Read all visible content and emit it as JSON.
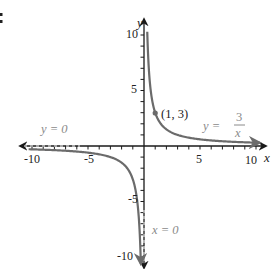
{
  "figure": {
    "panel_marker": "c"
  },
  "chart_data": {
    "type": "line",
    "title": "",
    "function": "y = 3/x",
    "xlabel": "x",
    "ylabel": "y",
    "xlim": [
      -10.5,
      10.5
    ],
    "ylim": [
      -10.5,
      10.5
    ],
    "x_ticks": [
      -10,
      -5,
      5,
      10
    ],
    "y_ticks": [
      10,
      5,
      -5,
      -10
    ],
    "tick_labels": {
      "x_neg10": "-10",
      "x_neg5": "-5",
      "x_5": "5",
      "x_10": "10",
      "y_10": "10",
      "y_5": "5",
      "y_neg5": "-5",
      "y_neg10": "-10"
    },
    "grid": false,
    "series": [
      {
        "name": "y = 3/x (positive branch)",
        "points": [
          [
            0.3,
            10
          ],
          [
            0.5,
            6
          ],
          [
            1,
            3
          ],
          [
            1.5,
            2
          ],
          [
            2,
            1.5
          ],
          [
            3,
            1
          ],
          [
            5,
            0.6
          ],
          [
            7,
            0.43
          ],
          [
            10,
            0.3
          ]
        ]
      },
      {
        "name": "y = 3/x (negative branch)",
        "points": [
          [
            -10,
            -0.3
          ],
          [
            -7,
            -0.43
          ],
          [
            -5,
            -0.6
          ],
          [
            -3,
            -1
          ],
          [
            -2,
            -1.5
          ],
          [
            -1.5,
            -2
          ],
          [
            -1,
            -3
          ],
          [
            -0.5,
            -6
          ],
          [
            -0.3,
            -10
          ]
        ]
      }
    ],
    "annotations": {
      "point": {
        "x": 1,
        "y": 3,
        "label": "(1, 3)"
      },
      "function_label": {
        "lhs": "y =",
        "numerator": "3",
        "denominator": "x"
      },
      "horizontal_asymptote": "y = 0",
      "vertical_asymptote": "x = 0"
    },
    "colors": {
      "curve": "#6b6b6b",
      "axes": "#1a1a1a",
      "asymptote_label": "#8a8a8a"
    }
  }
}
